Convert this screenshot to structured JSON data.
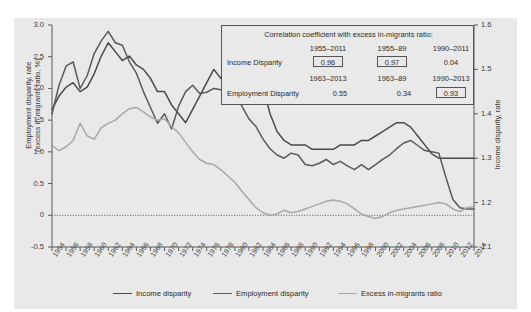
{
  "chart_data": {
    "type": "line",
    "title": "",
    "xlabel": "",
    "ylabel": "Employment disparity, rate (excess in-migrants ratio, %)",
    "ylabel_line1": "Employment disparity, rate",
    "ylabel_line2": "(excess in-migrants ratio, %)",
    "y2label": "Income disparity, rate",
    "ylim": [
      -0.5,
      3.0
    ],
    "y2lim": [
      1.1,
      1.6
    ],
    "yticks": [
      "3.0",
      "2.5",
      "2.0",
      "1.5",
      "1.0",
      "0.5",
      "0",
      "-0.5"
    ],
    "ytick_values": [
      3.0,
      2.5,
      2.0,
      1.5,
      1.0,
      0.5,
      0,
      -0.5
    ],
    "y2ticks": [
      "1.6",
      "1.5",
      "1.4",
      "1.3",
      "1.2",
      "1.1"
    ],
    "y2tick_values": [
      1.6,
      1.5,
      1.4,
      1.3,
      1.2,
      1.1
    ],
    "grid": false,
    "zero_line": true,
    "legend_position": "bottom",
    "x": [
      1954,
      1955,
      1956,
      1957,
      1958,
      1959,
      1960,
      1961,
      1962,
      1963,
      1964,
      1965,
      1966,
      1967,
      1968,
      1969,
      1970,
      1971,
      1972,
      1973,
      1974,
      1975,
      1976,
      1977,
      1978,
      1979,
      1980,
      1981,
      1982,
      1983,
      1984,
      1985,
      1986,
      1987,
      1988,
      1989,
      1990,
      1991,
      1992,
      1993,
      1994,
      1995,
      1996,
      1997,
      1998,
      1999,
      2000,
      2001,
      2002,
      2003,
      2004,
      2005,
      2006,
      2007,
      2008,
      2009,
      2010,
      2011,
      2012,
      2013,
      2014
    ],
    "xticks": [
      "1954",
      "1956",
      "1958",
      "1960",
      "1962",
      "1964",
      "1966",
      "1968",
      "1970",
      "1972",
      "1974",
      "1976",
      "1978",
      "1980",
      "1982",
      "1984",
      "1986",
      "1988",
      "1990",
      "1992",
      "1994",
      "1996",
      "1998",
      "2000",
      "2002",
      "2004",
      "2006",
      "2008",
      "2010",
      "2012",
      "2014"
    ],
    "series": [
      {
        "name": "Income disparity",
        "axis": "right",
        "color": "#4a4a4a",
        "values": [
          1.41,
          1.44,
          1.46,
          1.47,
          1.45,
          1.46,
          1.49,
          1.53,
          1.56,
          1.54,
          1.52,
          1.53,
          1.51,
          1.5,
          1.48,
          1.45,
          1.45,
          1.42,
          1.4,
          1.38,
          1.41,
          1.44,
          1.47,
          1.5,
          1.48,
          1.47,
          1.47,
          1.51,
          1.48,
          1.5,
          1.46,
          1.4,
          1.36,
          1.34,
          1.33,
          1.33,
          1.33,
          1.32,
          1.32,
          1.32,
          1.32,
          1.33,
          1.33,
          1.33,
          1.34,
          1.34,
          1.35,
          1.36,
          1.37,
          1.38,
          1.38,
          1.37,
          1.35,
          1.33,
          1.31,
          1.3,
          1.3,
          1.3,
          1.3,
          1.3,
          1.3
        ]
      },
      {
        "name": "Employment disparity",
        "axis": "left",
        "color": "#5a5a5a",
        "values": [
          1.6,
          2.05,
          2.35,
          2.42,
          2.0,
          2.2,
          2.55,
          2.75,
          2.9,
          2.72,
          2.68,
          2.42,
          2.24,
          1.95,
          1.7,
          1.45,
          1.6,
          1.36,
          1.72,
          1.95,
          2.05,
          1.92,
          1.94,
          2.0,
          1.98,
          1.96,
          1.9,
          1.72,
          1.52,
          1.4,
          1.2,
          1.05,
          0.95,
          0.9,
          0.98,
          0.95,
          0.8,
          0.78,
          0.82,
          0.88,
          0.8,
          0.85,
          0.78,
          0.72,
          0.8,
          0.72,
          0.8,
          0.88,
          0.95,
          1.05,
          1.14,
          1.18,
          1.1,
          1.02,
          1.0,
          0.98,
          0.6,
          0.25,
          0.12,
          0.1,
          0.1
        ]
      },
      {
        "name": "Excess in-migrants ratio",
        "axis": "left",
        "color": "#a8a8a8",
        "values": [
          1.1,
          1.02,
          1.08,
          1.18,
          1.45,
          1.25,
          1.2,
          1.38,
          1.45,
          1.5,
          1.6,
          1.68,
          1.7,
          1.63,
          1.55,
          1.5,
          1.52,
          1.4,
          1.3,
          1.15,
          1.0,
          0.88,
          0.82,
          0.8,
          0.72,
          0.62,
          0.52,
          0.38,
          0.25,
          0.12,
          0.04,
          0.0,
          0.02,
          0.08,
          0.04,
          0.06,
          0.1,
          0.14,
          0.18,
          0.22,
          0.24,
          0.22,
          0.18,
          0.1,
          0.02,
          -0.02,
          -0.05,
          -0.02,
          0.04,
          0.08,
          0.1,
          0.12,
          0.14,
          0.16,
          0.18,
          0.2,
          0.18,
          0.1,
          0.06,
          0.12,
          0.14
        ]
      }
    ]
  },
  "correlation_box": {
    "title": "Correlation coefficient with excess in-migrants ratio:",
    "income_row": {
      "label": "Income Disparity",
      "periods": [
        "1955–2011",
        "1955–89",
        "1990–2011"
      ],
      "values": [
        "0.96",
        "0.97",
        "0.04"
      ],
      "boxed": [
        true,
        true,
        false
      ]
    },
    "employment_row": {
      "label": "Employment Disparity",
      "periods": [
        "1963–2013",
        "1963–89",
        "1990–2013"
      ],
      "values": [
        "0.55",
        "0.34",
        "0.93"
      ],
      "boxed": [
        false,
        false,
        true
      ]
    }
  },
  "legend": {
    "items": [
      {
        "label": "Income disparity",
        "color": "#4a4a4a"
      },
      {
        "label": "Employment disparity",
        "color": "#5a5a5a"
      },
      {
        "label": "Excess in-migrants ratio",
        "color": "#a8a8a8"
      }
    ]
  },
  "colors": {
    "panel_bg": "#e9e9e9",
    "axis": "#5a5a5a",
    "income": "#4a4a4a",
    "employment": "#5a5a5a",
    "migrants": "#a8a8a8"
  }
}
